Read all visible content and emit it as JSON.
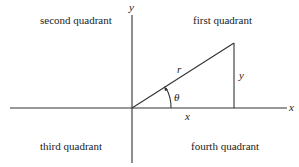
{
  "quadrants": {
    "first": "first quadrant",
    "second": "second quadrant",
    "third": "third quadrant",
    "fourth": "fourth quadrant"
  },
  "axes": {
    "x_label": "x",
    "y_label": "y"
  },
  "triangle": {
    "hypotenuse_label": "r",
    "opposite_label": "y",
    "adjacent_label": "x",
    "angle_label": "θ"
  },
  "colors": {
    "line": "#333333",
    "text": "#222222",
    "background": "#ffffff"
  }
}
